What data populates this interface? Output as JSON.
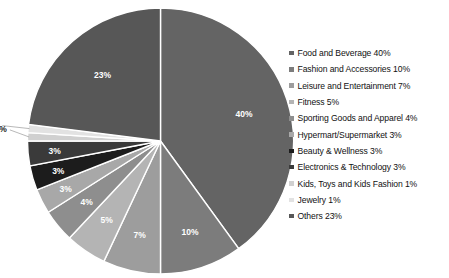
{
  "chart_data": {
    "type": "pie",
    "title": "",
    "xlabel": "",
    "ylabel": "",
    "legend_position": "right",
    "grid": false,
    "start_angle_deg": 0,
    "direction": "clockwise",
    "categories": [
      "Food and Beverage",
      "Fashion and Accessories",
      "Leisure and Entertainment",
      "Fitness",
      "Sporting Goods and Apparel",
      "Hypermart/Supermarket",
      "Beauty & Wellness",
      "Electronics & Technology",
      "Kids, Toys and Kids Fashion",
      "Jewelry",
      "Others"
    ],
    "values": [
      40,
      10,
      7,
      5,
      4,
      3,
      3,
      3,
      1,
      1,
      23
    ],
    "value_labels": [
      "40%",
      "10%",
      "7%",
      "5%",
      "4%",
      "3%",
      "3%",
      "3%",
      "1%",
      "1%",
      "23%"
    ],
    "colors": [
      "#646464",
      "#7c7c7c",
      "#9d9d9d",
      "#b4b4b4",
      "#8e8e8e",
      "#a8a8a8",
      "#1c1c1c",
      "#3a3a3a",
      "#d0d0d0",
      "#e2e2e2",
      "#575757"
    ],
    "label_placement": [
      "inside",
      "inside",
      "inside",
      "inside",
      "inside",
      "inside",
      "inside",
      "inside",
      "outside",
      "outside",
      "inside"
    ]
  },
  "legend": {
    "items": [
      {
        "label": "Food and Beverage 40%"
      },
      {
        "label": "Fashion and Accessories 10%"
      },
      {
        "label": "Leisure and Entertainment 7%"
      },
      {
        "label": "Fitness 5%"
      },
      {
        "label": "Sporting Goods and Apparel 4%"
      },
      {
        "label": "Hypermart/Supermarket 3%"
      },
      {
        "label": "Beauty & Wellness 3%"
      },
      {
        "label": "Electronics & Technology 3%"
      },
      {
        "label": "Kids, Toys and Kids Fashion 1%"
      },
      {
        "label": "Jewelry 1%"
      },
      {
        "label": "Others 23%"
      }
    ]
  }
}
